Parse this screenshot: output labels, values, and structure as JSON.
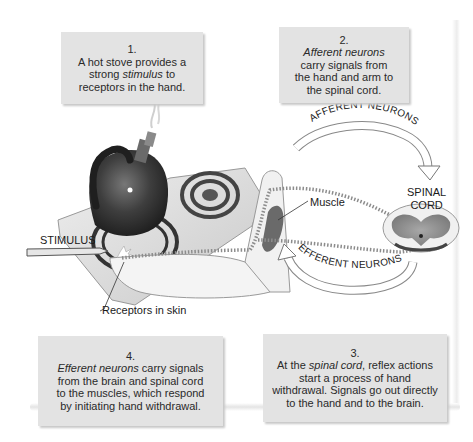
{
  "figure": {
    "steps": [
      {
        "number": "1.",
        "lines": [
          {
            "pre": "A hot stove provides a",
            "em": "",
            "post": ""
          },
          {
            "pre": "strong ",
            "em": "stimulus",
            "post": " to"
          },
          {
            "pre": "receptors in the hand.",
            "em": "",
            "post": ""
          }
        ]
      },
      {
        "number": "2.",
        "lines": [
          {
            "pre": "",
            "em": "Afferent neurons",
            "post": ""
          },
          {
            "pre": "carry signals from",
            "em": "",
            "post": ""
          },
          {
            "pre": "the hand and arm to",
            "em": "",
            "post": ""
          },
          {
            "pre": "the spinal cord.",
            "em": "",
            "post": ""
          }
        ]
      },
      {
        "number": "3.",
        "lines": [
          {
            "pre": "At the ",
            "em": "spinal cord",
            "post": ", reflex actions"
          },
          {
            "pre": "start a process of hand",
            "em": "",
            "post": ""
          },
          {
            "pre": "withdrawal. Signals go out directly",
            "em": "",
            "post": ""
          },
          {
            "pre": "to the hand and to the brain.",
            "em": "",
            "post": ""
          }
        ]
      },
      {
        "number": "4.",
        "lines": [
          {
            "pre": "",
            "em": "Efferent neurons",
            "post": " carry signals"
          },
          {
            "pre": "from the brain and spinal cord",
            "em": "",
            "post": ""
          },
          {
            "pre": "to the muscles, which respond",
            "em": "",
            "post": ""
          },
          {
            "pre": "by initiating hand withdrawal.",
            "em": "",
            "post": ""
          }
        ]
      }
    ],
    "labels": {
      "stimulus": "STIMULUS",
      "muscle": "Muscle",
      "spinal_cord_line1": "SPINAL",
      "spinal_cord_line2": "CORD",
      "receptors": "Receptors in skin",
      "afferent_arrow": "AFFERENT NEURONS",
      "efferent_arrow": "EFFERENT NEURONS"
    },
    "colors": {
      "caption_bg": "#e3e3e3",
      "text": "#2a2a2a",
      "kettle": "#3a3a3a",
      "stove": "#dcdcdc",
      "spinal_cord": "#8a8a8a"
    }
  }
}
